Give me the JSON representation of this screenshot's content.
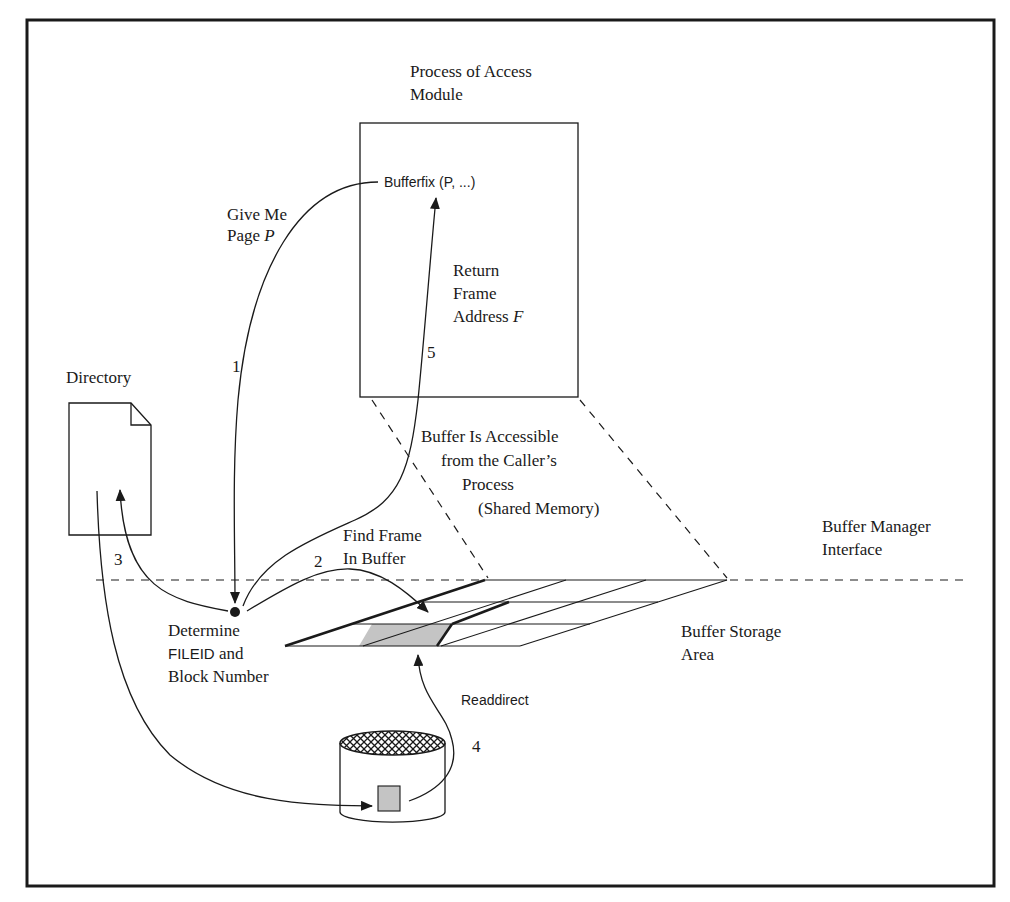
{
  "labels": {
    "process_title_1": "Process of Access",
    "process_title_2": "Module",
    "bufferfix_call": "Bufferfix (P, ...)",
    "give_me_1": "Give Me",
    "give_me_2": "Page",
    "give_me_var": "P",
    "return_1": "Return",
    "return_2": "Frame",
    "return_3": "Address",
    "return_var": "F",
    "step_1": "1",
    "step_2": "2",
    "step_3": "3",
    "step_4": "4",
    "step_5": "5",
    "directory": "Directory",
    "accessible_1": "Buffer Is Accessible",
    "accessible_2": "from the Caller’s",
    "accessible_3": "Process",
    "accessible_4": "(Shared Memory)",
    "find_frame_1": "Find Frame",
    "find_frame_2": "In Buffer",
    "bm_interface_1": "Buffer Manager",
    "bm_interface_2": "Interface",
    "determine_1": "Determine",
    "determine_2a": "FILEID",
    "determine_2b": " and",
    "determine_3": "Block Number",
    "storage_1": "Buffer Storage",
    "storage_2": "Area",
    "readdirect": "Readdirect"
  },
  "colors": {
    "ink": "#1a1a1a",
    "frame_fill": "#b8b8b8",
    "block_fill": "#c4c4c4",
    "background": "#ffffff"
  }
}
